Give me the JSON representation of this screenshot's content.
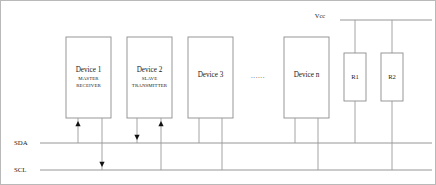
{
  "diagram": {
    "power_rail": {
      "label": "Vcc"
    },
    "buses": [
      {
        "id": "sda",
        "label": "SDA"
      },
      {
        "id": "scl",
        "label": "SCL"
      }
    ],
    "ellipsis": "......",
    "devices": [
      {
        "id": "device1",
        "title": "Device 1",
        "role_line1": "MASTER",
        "role_line2": "RECEIVER"
      },
      {
        "id": "device2",
        "title": "Device 2",
        "role_line1": "SLAVE",
        "role_line2": "TRANSMITTER"
      },
      {
        "id": "device3",
        "title": "Device 3",
        "role_line1": "",
        "role_line2": ""
      },
      {
        "id": "devicen",
        "title": "Device n",
        "role_line1": "",
        "role_line2": ""
      }
    ],
    "resistors": [
      {
        "id": "r1",
        "label": "R1"
      },
      {
        "id": "r2",
        "label": "R2"
      }
    ],
    "colors": {
      "background": "#ffffff",
      "box_stroke": "#8c8c8c",
      "wire": "#9a9a9a",
      "bus": "#8a8a8a",
      "frame": "#b9b9b9",
      "text": "#1a1a1a",
      "arrow": "#111111"
    }
  }
}
